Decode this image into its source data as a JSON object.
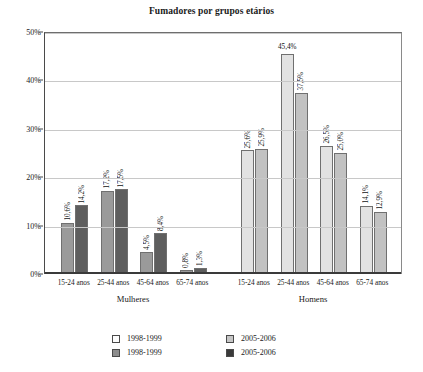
{
  "chart_data": {
    "type": "bar",
    "title": "Fumadores por grupos etários",
    "xlabel": "",
    "ylabel": "",
    "ylim": [
      0,
      50
    ],
    "ytick_labels": [
      "0%",
      "10%",
      "20%",
      "30%",
      "40%",
      "50%"
    ],
    "ytick_values": [
      0,
      10,
      20,
      30,
      40,
      50
    ],
    "grid": true,
    "legend_position": "bottom",
    "groups": [
      {
        "name": "Mulheres",
        "categories": [
          "15-24 anos",
          "25-44 anos",
          "45-64 anos",
          "65-74 anos"
        ],
        "series": [
          {
            "name": "1998-1999",
            "color": "#9a9a9a",
            "values": [
              10.6,
              17.2,
              4.5,
              0.8
            ],
            "labels": [
              "10,6%",
              "17,2%",
              "4,5%",
              "0,8%"
            ]
          },
          {
            "name": "2005-2006",
            "color": "#5e5e5e",
            "values": [
              14.2,
              17.5,
              8.4,
              1.3
            ],
            "labels": [
              "14,2%",
              "17,5%",
              "8,4%",
              "1,3%"
            ]
          }
        ]
      },
      {
        "name": "Homens",
        "categories": [
          "15-24 anos",
          "25-44 anos",
          "45-64 anos",
          "65-74 anos"
        ],
        "series": [
          {
            "name": "1998-1999",
            "color": "#e2e2e2",
            "values": [
              25.6,
              45.4,
              26.5,
              14.1
            ],
            "labels": [
              "25,6%",
              "45,4%",
              "26,5%",
              "14,1%"
            ]
          },
          {
            "name": "2005-2006",
            "color": "#c2c2c2",
            "values": [
              25.9,
              37.5,
              25.0,
              12.9
            ],
            "labels": [
              "25,9%",
              "37,5%",
              "25,0%",
              "12,9%"
            ]
          }
        ]
      }
    ],
    "legend": [
      {
        "label": "1998-1999",
        "swatch": "sw-a",
        "color": "#fdfdfd"
      },
      {
        "label": "2005-2006",
        "swatch": "sw-c",
        "color": "#c6c6c6"
      },
      {
        "label": "1998-1999",
        "swatch": "sw-b",
        "color": "#8d8d8d"
      },
      {
        "label": "2005-2006",
        "swatch": "sw-d",
        "color": "#3a3a3a"
      }
    ]
  }
}
